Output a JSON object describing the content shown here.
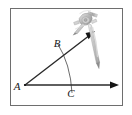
{
  "figure": {
    "kind": "geometry-construction-diagram",
    "frame": {
      "border_color": "#6e6e6e",
      "background_color": "#ffffff",
      "x": 10,
      "y": 8,
      "width": 113,
      "height": 98
    },
    "colors": {
      "ray": "#2b2b2b",
      "arc": "#4a4a4a",
      "label": "#1a1a1a",
      "compass_light": "#d6d6d6",
      "compass_mid": "#a8a8a8",
      "compass_dark": "#6b6b6b"
    },
    "labels": [
      {
        "name": "vertex-label-a",
        "text": "A",
        "x": 19,
        "y": 90
      },
      {
        "name": "point-label-b",
        "text": "B",
        "x": 57,
        "y": 47
      },
      {
        "name": "point-label-c",
        "text": "C",
        "x": 71,
        "y": 96
      }
    ],
    "points": {
      "vertex_a": {
        "x": 25,
        "y": 85
      },
      "point_b": {
        "x": 62,
        "y": 56
      },
      "point_c": {
        "x": 70,
        "y": 85
      }
    },
    "rays": [
      {
        "name": "ray-horizontal-ac",
        "from": {
          "x": 25,
          "y": 85
        },
        "to": {
          "x": 118,
          "y": 85
        },
        "arrowhead": true
      },
      {
        "name": "ray-slanted-ab",
        "from": {
          "x": 25,
          "y": 85
        },
        "to": {
          "x": 94,
          "y": 32
        },
        "arrowhead": true
      }
    ],
    "arc": {
      "name": "construction-arc",
      "start": {
        "x": 57,
        "y": 44
      },
      "end": {
        "x": 72,
        "y": 92
      },
      "radius": 46,
      "center": {
        "x": 25,
        "y": 85
      }
    },
    "compass": {
      "name": "compass-tool",
      "hinge": {
        "x": 88,
        "y": 16
      },
      "pencil_leg_tip": {
        "x": 99,
        "y": 67
      },
      "needle_leg_tip": {
        "x": 75,
        "y": 33
      }
    }
  }
}
